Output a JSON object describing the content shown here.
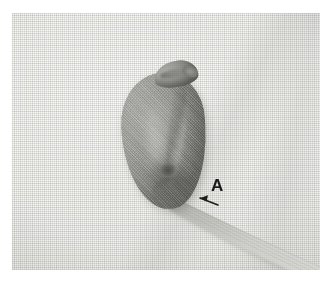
{
  "figure": {
    "domain_kind": "photograph",
    "annotations": [
      {
        "id": "annotation-a",
        "label": "A",
        "points_to": "ribbon-strap emerging from the base of the pouch",
        "color": "#161616"
      }
    ],
    "elements": {
      "background_name": "white woven cloth backdrop",
      "specimen_name": "mesh pouch specimen",
      "knot_name": "twisted top closure",
      "neck_name": "puckered base opening",
      "ribbon_name": "ribbon strap"
    },
    "colors": {
      "backdrop": "#f4f4f2",
      "specimen_mid": "#8d8d89",
      "specimen_light": "#b2b2ae",
      "specimen_dark": "#6f6f6b",
      "ribbon": "#c9c9c5",
      "label": "#161616",
      "plate_border": "#b4b4b2"
    }
  }
}
